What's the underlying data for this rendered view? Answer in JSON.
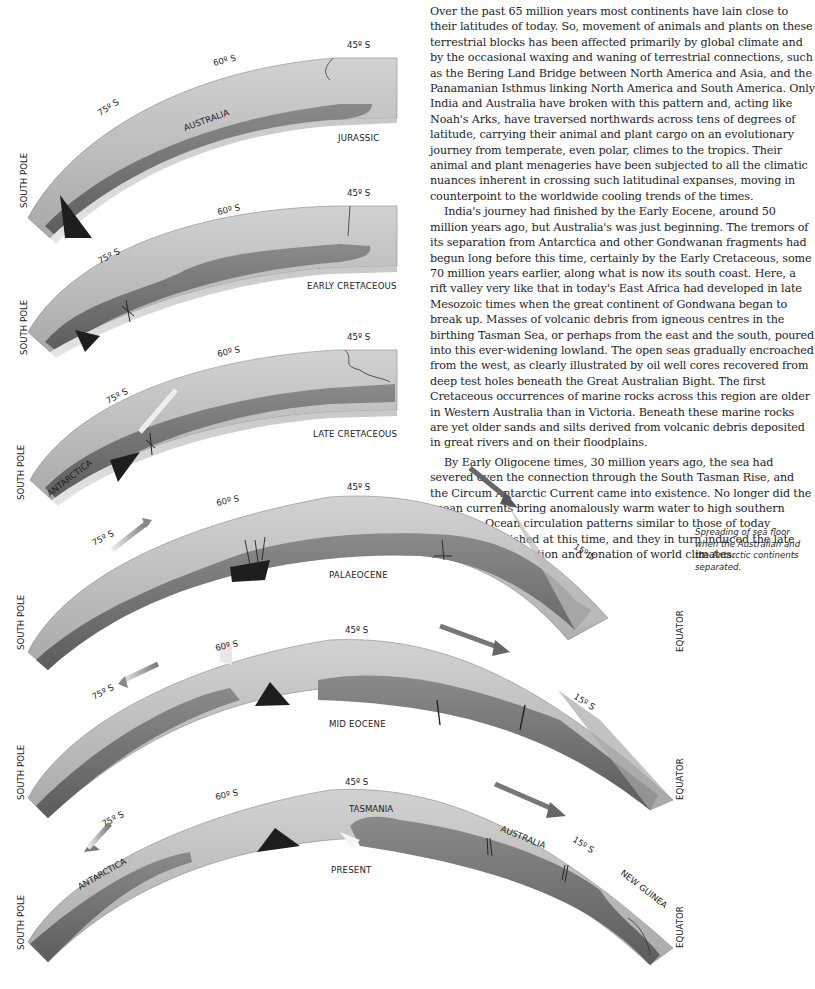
{
  "article": {
    "paragraphs": [
      "Over the past 65 million years most continents have lain close to their latitudes of today. So, movement of animals and plants on these terrestrial blocks has been affected primarily by global climate and by the occasional waxing and waning of terrestrial connections, such as the Bering Land Bridge between North America and Asia, and the Panamanian Isthmus linking North America and South America. Only India and Australia have broken with this pattern and, acting like Noah's Arks, have traversed northwards across tens of degrees of latitude, carrying their animal and plant cargo on an evolutionary journey from temperate, even polar, climes to the tropics. Their animal and plant menageries have been subjected to all the climatic nuances inherent in crossing such latitudinal expanses, moving in counterpoint to the worldwide cooling trends of the times.",
      "India's journey had finished by the Early Eocene, around 50 million years ago, but Australia's was just beginning. The tremors of its separation from Antarctica and other Gondwanan fragments had begun long before this time, certainly by the Early Cretaceous, some 70 million years earlier, along what is now its south coast. Here, a rift valley very like that in today's East Africa had developed in late Mesozoic times when the great continent of Gondwana began to break up. Masses of volcanic debris from igneous centres in the birthing Tasman Sea, or perhaps from the east and the south, poured into this ever-widening lowland. The open seas gradually encroached from the west, as clearly illustrated by oil well cores recovered from deep test holes beneath the Great Australian Bight. The first Cretaceous occurrences of marine rocks across this region are older in Western Australia than in Victoria. Beneath these marine rocks are yet older sands and silts derived from volcanic debris deposited in great rivers and on their floodplains.",
      "By Early Oligocene times, 30 million years ago, the sea had severed even the connection through the South Tasman Rise, and the Circum Antarctic Current came into existence. No longer did the ocean currents bring anomalously warm water to high southern latitudes. Ocean circulation patterns similar to those of today became established at this time, and they in turn induced the late Cainozoic refrigeration and zonation of world climates."
    ]
  },
  "figure": {
    "caption": "Spreading of sea floor when the Australian and the Antarctic continents separated.",
    "axis_labels": {
      "south_pole": "SOUTH POLE",
      "equator": "EQUATOR"
    },
    "panels": [
      {
        "epoch": "JURASSIC",
        "lat_75": "75º S",
        "lat_60": "60º S",
        "lat_45": "45º S",
        "landmass": "AUSTRALIA"
      },
      {
        "epoch": "EARLY CRETACEOUS",
        "lat_75": "75º S",
        "lat_60": "60º S",
        "lat_45": "45º S"
      },
      {
        "epoch": "LATE CRETACEOUS",
        "lat_75": "75º S",
        "lat_60": "60º S",
        "lat_45": "45º S",
        "landmass": "ANTARCTICA"
      },
      {
        "epoch": "PALAEOCENE",
        "lat_75": "75º S",
        "lat_60": "60º S",
        "lat_45": "45º S",
        "lat_15": "15º S"
      },
      {
        "epoch": "MID EOCENE",
        "lat_75": "75º S",
        "lat_60": "60º S",
        "lat_45": "45º S",
        "lat_15": "15º S"
      },
      {
        "epoch": "PRESENT",
        "lat_75": "75º S",
        "lat_60": "60º S",
        "lat_45": "45º S",
        "lat_15": "15º S",
        "landmass_1": "ANTARCTICA",
        "landmass_2": "TASMANIA",
        "landmass_3": "AUSTRALIA",
        "landmass_4": "NEW GUINEA"
      }
    ]
  }
}
